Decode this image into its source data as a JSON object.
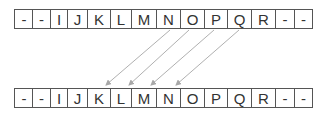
{
  "diagram": {
    "top_row": {
      "label": "source",
      "cells": [
        "-",
        "-",
        "I",
        "J",
        "K",
        "L",
        "M",
        "N",
        "O",
        "P",
        "Q",
        "R",
        "-",
        "-"
      ]
    },
    "bottom_row": {
      "label": "destination",
      "cells": [
        "-",
        "-",
        "I",
        "J",
        "K",
        "L",
        "M",
        "N",
        "O",
        "P",
        "Q",
        "R",
        "-",
        "-"
      ]
    },
    "arrows": [
      {
        "from": "N",
        "to": "K"
      },
      {
        "from": "O",
        "to": "L"
      },
      {
        "from": "P",
        "to": "M"
      },
      {
        "from": "Q",
        "to": "N"
      }
    ],
    "colors": {
      "border": "#555555",
      "text": "#333333",
      "arrow": "#aaaaaa"
    }
  }
}
